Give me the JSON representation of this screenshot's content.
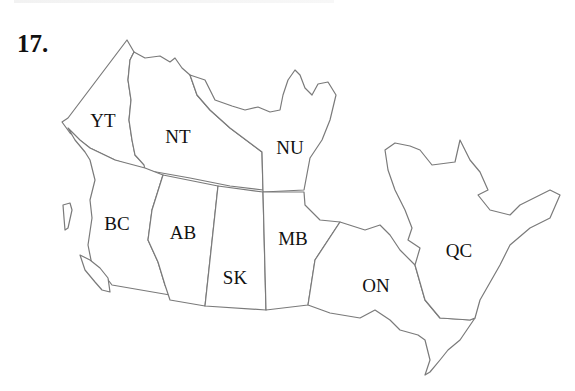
{
  "question": {
    "number": "17."
  },
  "map": {
    "type": "political-outline",
    "country": "Canada",
    "provinces": [
      {
        "code": "YT",
        "label": "YT",
        "x": 103,
        "y": 127
      },
      {
        "code": "NT",
        "label": "NT",
        "x": 178,
        "y": 143
      },
      {
        "code": "NU",
        "label": "NU",
        "x": 290,
        "y": 154
      },
      {
        "code": "BC",
        "label": "BC",
        "x": 117,
        "y": 230
      },
      {
        "code": "AB",
        "label": "AB",
        "x": 183,
        "y": 239
      },
      {
        "code": "SK",
        "label": "SK",
        "x": 235,
        "y": 284
      },
      {
        "code": "MB",
        "label": "MB",
        "x": 293,
        "y": 245
      },
      {
        "code": "ON",
        "label": "ON",
        "x": 376,
        "y": 292
      },
      {
        "code": "QC",
        "label": "QC",
        "x": 459,
        "y": 257
      }
    ]
  }
}
